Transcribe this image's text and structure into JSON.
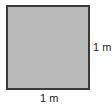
{
  "diagram": {
    "shape": "square",
    "fill_color": "#b9b9b9",
    "border_color": "#3a3a3a",
    "side_label": "1 m",
    "bottom_label": "1 m"
  }
}
